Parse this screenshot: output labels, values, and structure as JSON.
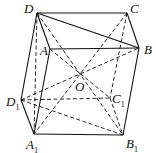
{
  "diagram": {
    "type": "parallelepiped",
    "points": {
      "D": {
        "label": "D",
        "x": 37,
        "y": 13
      },
      "C": {
        "label": "C",
        "x": 127,
        "y": 13
      },
      "A": {
        "label": "A",
        "x": 50,
        "y": 49
      },
      "B": {
        "label": "B",
        "x": 139,
        "y": 48
      },
      "O": {
        "label": "O",
        "x": 79,
        "y": 77
      },
      "D1": {
        "label": "D",
        "sub": "1",
        "x": 21,
        "y": 100
      },
      "C1": {
        "label": "C",
        "sub": "1",
        "x": 110,
        "y": 98
      },
      "A1": {
        "label": "A",
        "sub": "1",
        "x": 34,
        "y": 134
      },
      "B1": {
        "label": "B",
        "sub": "1",
        "x": 123,
        "y": 135
      }
    },
    "solid_edges": [
      [
        "D",
        "C"
      ],
      [
        "D",
        "B"
      ],
      [
        "C",
        "B"
      ],
      [
        "A",
        "B"
      ],
      [
        "D",
        "A"
      ],
      [
        "D",
        "D1"
      ],
      [
        "D1",
        "A1"
      ],
      [
        "A1",
        "B1"
      ],
      [
        "B1",
        "B"
      ],
      [
        "A",
        "A1"
      ]
    ],
    "dashed_edges": [
      [
        "D",
        "B1"
      ],
      [
        "C",
        "A1"
      ],
      [
        "D1",
        "B"
      ],
      [
        "A",
        "C1"
      ],
      [
        "D1",
        "C1"
      ],
      [
        "C",
        "C1"
      ],
      [
        "C1",
        "B1"
      ],
      [
        "D1",
        "B1"
      ],
      [
        "A1",
        "D"
      ]
    ]
  }
}
